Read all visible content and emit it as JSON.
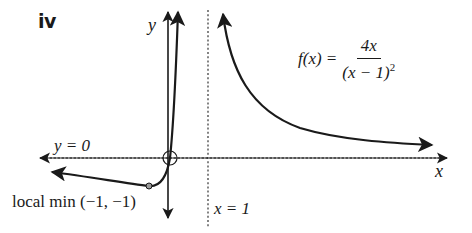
{
  "figure": {
    "part_label": "iv",
    "function": {
      "lhs": "f(x) =",
      "numerator": "4x",
      "denominator_base": "(x − 1)",
      "denominator_exponent": "2"
    },
    "axes": {
      "x_label": "x",
      "y_label": "y"
    },
    "asymptotes": {
      "horizontal": "y = 0",
      "vertical": "x = 1"
    },
    "annotations": {
      "local_min": "local min (−1, −1)",
      "intercept": "(0, 0)"
    },
    "colors": {
      "curve": "#1a1a1a",
      "axis": "#1a1a1a",
      "asymptote": "#333333",
      "point_fill": "#9a9a9a",
      "background": "#ffffff"
    }
  }
}
